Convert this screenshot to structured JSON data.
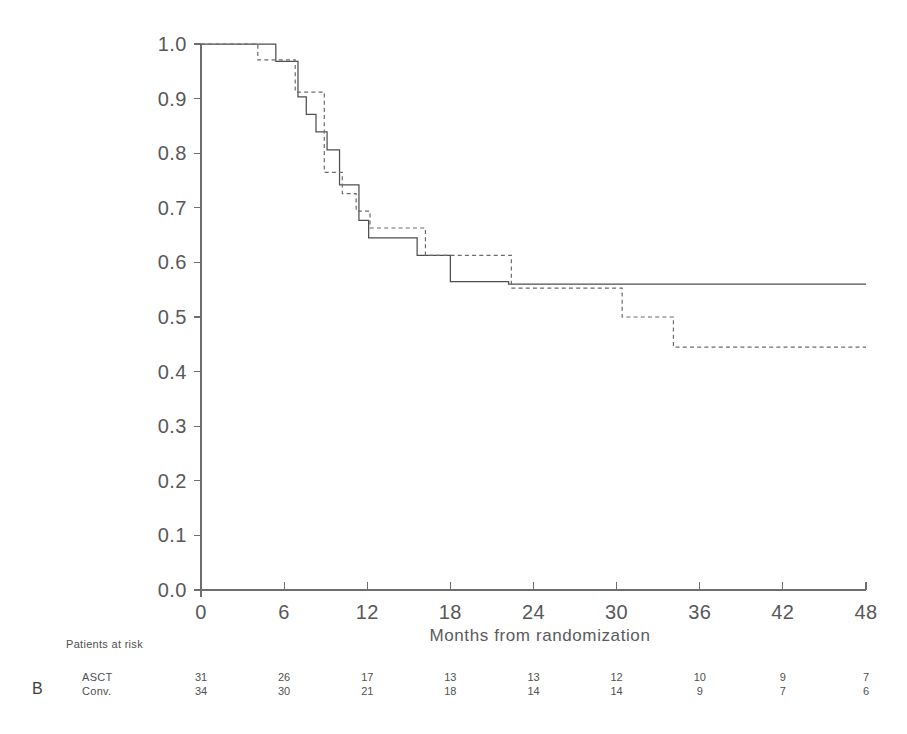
{
  "figure": {
    "panel_label": "B",
    "xlabel": "Months from randomization",
    "risk_header": "Patients at risk"
  },
  "chart_data": {
    "type": "line",
    "title": "",
    "xlabel": "Months from randomization",
    "ylabel": "",
    "xlim": [
      0,
      48
    ],
    "ylim": [
      0.0,
      1.0
    ],
    "xticks": [
      0,
      6,
      12,
      18,
      24,
      30,
      36,
      42,
      48
    ],
    "xtick_labels": [
      "0",
      "6",
      "12",
      "18",
      "24",
      "30",
      "36",
      "42",
      "48"
    ],
    "yticks": [
      0.0,
      0.1,
      0.2,
      0.3,
      0.4,
      0.5,
      0.6,
      0.7,
      0.8,
      0.9,
      1.0
    ],
    "ytick_labels": [
      "0.0",
      "0.1",
      "0.2",
      "0.3",
      "0.4",
      "0.5",
      "0.6",
      "0.7",
      "0.8",
      "0.9",
      "1.0"
    ],
    "grid": false,
    "legend_position": "none",
    "step_shape": "hv",
    "series": [
      {
        "name": "ASCT",
        "style": "solid",
        "color": "#4d4e50",
        "x": [
          0,
          5.4,
          5.4,
          7.0,
          7.0,
          7.6,
          7.6,
          8.3,
          8.3,
          9.1,
          9.1,
          10.0,
          10.0,
          11.4,
          11.4,
          12.1,
          12.1,
          15.6,
          15.6,
          18.0,
          18.0,
          22.2,
          22.2,
          48
        ],
        "y": [
          1.0,
          1.0,
          0.968,
          0.968,
          0.903,
          0.903,
          0.871,
          0.871,
          0.839,
          0.839,
          0.806,
          0.806,
          0.742,
          0.742,
          0.677,
          0.677,
          0.645,
          0.645,
          0.613,
          0.613,
          0.565,
          0.565,
          0.56,
          0.56
        ]
      },
      {
        "name": "Conv.",
        "style": "dashed",
        "color": "#6a6b6d",
        "x": [
          0,
          4.1,
          4.1,
          6.8,
          6.8,
          7.4,
          7.4,
          8.9,
          8.9,
          10.2,
          10.2,
          11.2,
          11.2,
          12.2,
          12.2,
          14.3,
          14.3,
          16.2,
          16.2,
          20.0,
          20.0,
          22.4,
          22.4,
          30.4,
          30.4,
          34.1,
          34.1,
          48
        ],
        "y": [
          1.0,
          1.0,
          0.971,
          0.971,
          0.912,
          0.912,
          0.912,
          0.912,
          0.765,
          0.765,
          0.726,
          0.726,
          0.694,
          0.694,
          0.663,
          0.663,
          0.663,
          0.663,
          0.613,
          0.613,
          0.613,
          0.613,
          0.553,
          0.553,
          0.5,
          0.5,
          0.445,
          0.445
        ]
      }
    ]
  },
  "risk_table": {
    "columns": [
      0,
      6,
      12,
      18,
      24,
      30,
      36,
      42,
      48
    ],
    "rows": [
      {
        "label": "ASCT",
        "values": [
          "31",
          "26",
          "17",
          "13",
          "13",
          "12",
          "10",
          "9",
          "7"
        ]
      },
      {
        "label": "Conv.",
        "values": [
          "34",
          "30",
          "21",
          "18",
          "14",
          "14",
          "9",
          "7",
          "6"
        ]
      }
    ]
  }
}
